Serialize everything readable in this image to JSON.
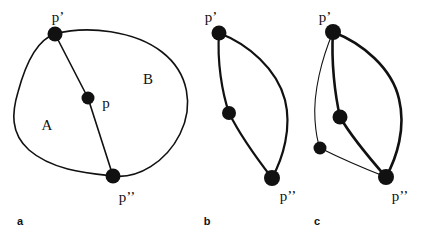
{
  "figure": {
    "width": 429,
    "height": 238,
    "background_color": "#ffffff",
    "stroke_color": "#111111",
    "node_color": "#111111"
  },
  "panels": [
    {
      "letter": "a",
      "letter_pos": [
        20,
        221
      ],
      "description": "closed Jordan curve split into regions A and B by an arc through p",
      "labels": [
        {
          "name": "p-prime",
          "text": "p’",
          "pos": [
            58,
            17
          ]
        },
        {
          "name": "p",
          "text": "p",
          "pos": [
            106,
            103
          ]
        },
        {
          "name": "p-double-prime",
          "text": "p’’",
          "pos": [
            127,
            197
          ]
        },
        {
          "name": "region-a",
          "text": "A",
          "pos": [
            47,
            125
          ]
        },
        {
          "name": "region-b",
          "text": "B",
          "pos": [
            148,
            79
          ]
        }
      ],
      "nodes": [
        {
          "name": "node-p-prime",
          "cx": 55,
          "cy": 34,
          "r": 7.5
        },
        {
          "name": "node-p",
          "cx": 88,
          "cy": 98,
          "r": 6.5
        },
        {
          "name": "node-p-double-prime",
          "cx": 113,
          "cy": 176,
          "r": 7.5
        }
      ],
      "paths": [
        {
          "name": "outer-closed-curve",
          "d": "M 55 34 C 88 25 135 31 162 52 C 189 73 194 106 180 134 C 166 162 138 179 113 176 C 86 173 52 170 29 150 C 10 133 12 112 18 92 C 25 66 36 40 55 34 Z",
          "width": 1.6
        },
        {
          "name": "chord-p-prime-to-p-double-prime",
          "d": "M 55 34 L 88 98 L 113 176",
          "width": 1.6
        }
      ]
    },
    {
      "letter": "b",
      "letter_pos": [
        207,
        221
      ],
      "description": "two arcs from p-prime to p-double-prime, one passing through an interior node",
      "labels": [
        {
          "name": "p-prime",
          "text": "p’",
          "pos": [
            211,
            17
          ]
        },
        {
          "name": "p-double-prime",
          "text": "p’’",
          "pos": [
            288,
            196
          ]
        }
      ],
      "nodes": [
        {
          "name": "node-p-prime",
          "cx": 219,
          "cy": 33,
          "r": 7.5
        },
        {
          "name": "node-interior",
          "cx": 229,
          "cy": 113,
          "r": 7.0
        },
        {
          "name": "node-p-double-prime",
          "cx": 272,
          "cy": 178,
          "r": 8.0
        }
      ],
      "paths": [
        {
          "name": "arc-through-interior-node",
          "d": "M 219 33 C 217 62 222 92 229 113 C 240 135 258 160 272 178",
          "width": 2.2
        },
        {
          "name": "arc-right-bulge",
          "d": "M 219 33 C 248 44 277 69 285 100 C 292 128 283 158 272 178",
          "width": 2.2
        }
      ]
    },
    {
      "letter": "c",
      "letter_pos": [
        317,
        221
      ],
      "description": "three arcs from p-prime to p-double-prime: thick interior arc, thick right bulge, thin left arc through a lower-left node",
      "labels": [
        {
          "name": "p-prime",
          "text": "p’",
          "pos": [
            325,
            17
          ]
        },
        {
          "name": "p-double-prime",
          "text": "p’’",
          "pos": [
            400,
            196
          ]
        }
      ],
      "nodes": [
        {
          "name": "node-p-prime",
          "cx": 333,
          "cy": 32,
          "r": 8.0
        },
        {
          "name": "node-interior",
          "cx": 340,
          "cy": 117,
          "r": 7.5
        },
        {
          "name": "node-lower-left",
          "cx": 320,
          "cy": 148,
          "r": 6.5
        },
        {
          "name": "node-p-double-prime",
          "cx": 386,
          "cy": 177,
          "r": 8.0
        }
      ],
      "paths": [
        {
          "name": "arc-through-interior-node",
          "d": "M 333 32 C 331 62 335 95 340 117 C 352 138 372 161 386 177",
          "width": 2.6
        },
        {
          "name": "arc-right-bulge",
          "d": "M 333 32 C 362 43 392 68 399 99 C 406 128 397 157 386 177",
          "width": 2.6
        },
        {
          "name": "thin-arc-through-lower-left-node",
          "d": "M 333 32 C 322 58 313 92 315 120 C 316 135 318 143 320 148 C 336 156 368 170 386 177",
          "width": 1.1
        }
      ]
    }
  ]
}
